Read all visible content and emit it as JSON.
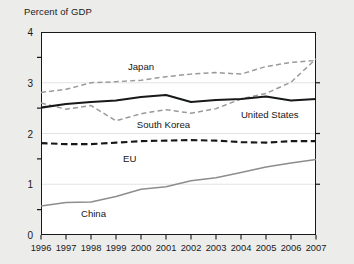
{
  "chart_data": {
    "type": "line",
    "title": "",
    "ylabel": "Percent of GDP",
    "xlabel": "",
    "ylim": [
      0,
      4
    ],
    "yticks": [
      "0",
      "1",
      "2",
      "3",
      "4"
    ],
    "ytick_values": [
      0,
      1,
      2,
      3,
      4
    ],
    "yminor_step": 0.5,
    "grid": "horizontal-faint",
    "legend": "inline-annotations",
    "x": [
      1996,
      1997,
      1998,
      1999,
      2000,
      2001,
      2002,
      2003,
      2004,
      2005,
      2006,
      2007
    ],
    "categories": [
      "1996",
      "1997",
      "1998",
      "1999",
      "2000",
      "2001",
      "2002",
      "2003",
      "2004",
      "2005",
      "2006",
      "2007"
    ],
    "series": [
      {
        "name": "Japan",
        "color": "#9a9a9a",
        "style": "dashed",
        "width": 1.5,
        "label_x": 2000.0,
        "label_y": 3.33,
        "values": [
          2.81,
          2.87,
          3.0,
          3.02,
          3.05,
          3.12,
          3.17,
          3.2,
          3.17,
          3.32,
          3.4,
          3.44
        ]
      },
      {
        "name": "South Korea",
        "color": "#9a9a9a",
        "style": "dashed",
        "width": 1.5,
        "label_x": 2000.9,
        "label_y": 2.18,
        "values": [
          2.6,
          2.48,
          2.55,
          2.25,
          2.39,
          2.47,
          2.4,
          2.49,
          2.68,
          2.79,
          3.01,
          3.47
        ]
      },
      {
        "name": "United States",
        "color": "#16181a",
        "style": "solid",
        "width": 2.1,
        "label_x": 2005.15,
        "label_y": 2.38,
        "values": [
          2.51,
          2.58,
          2.62,
          2.65,
          2.72,
          2.76,
          2.62,
          2.66,
          2.68,
          2.73,
          2.65,
          2.68
        ]
      },
      {
        "name": "EU",
        "color": "#16181a",
        "style": "dashed-bold",
        "width": 2.1,
        "label_x": 1999.55,
        "label_y": 1.52,
        "values": [
          1.81,
          1.79,
          1.79,
          1.82,
          1.85,
          1.86,
          1.87,
          1.86,
          1.83,
          1.82,
          1.85,
          1.85
        ]
      },
      {
        "name": "China",
        "color": "#8d8d8d",
        "style": "solid",
        "width": 1.5,
        "label_x": 1998.1,
        "label_y": 0.43,
        "values": [
          0.57,
          0.64,
          0.65,
          0.76,
          0.9,
          0.95,
          1.07,
          1.13,
          1.23,
          1.34,
          1.42,
          1.49
        ]
      }
    ]
  }
}
